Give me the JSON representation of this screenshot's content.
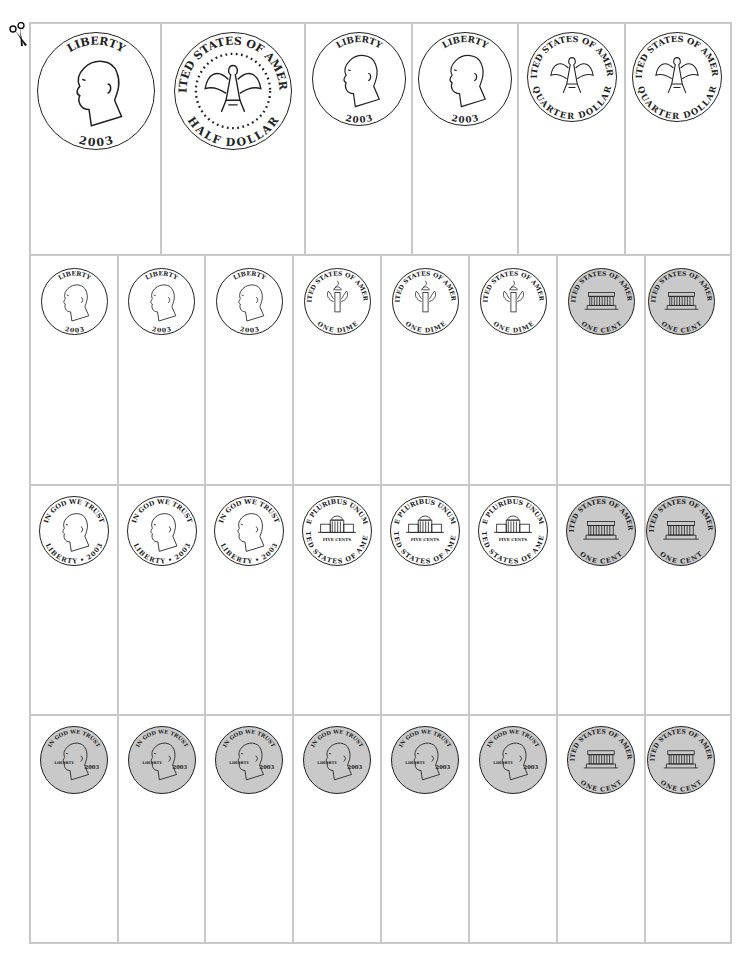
{
  "sheet": {
    "cut_marker": "scissors-icon",
    "rows": [
      {
        "name": "half-dollars-and-quarters",
        "cells": [
          {
            "coin": "half-dollar",
            "side": "heads",
            "top_text": "LIBERTY",
            "bottom_text": "2003"
          },
          {
            "coin": "half-dollar",
            "side": "tails",
            "top_text": "UNITED STATES OF AMERICA",
            "bottom_text": "HALF DOLLAR"
          },
          {
            "coin": "quarter",
            "side": "heads",
            "top_text": "LIBERTY",
            "bottom_text": "2003"
          },
          {
            "coin": "quarter",
            "side": "heads",
            "top_text": "LIBERTY",
            "bottom_text": "2003"
          },
          {
            "coin": "quarter",
            "side": "tails",
            "top_text": "UNITED STATES OF AMERICA",
            "bottom_text": "QUARTER DOLLAR"
          },
          {
            "coin": "quarter",
            "side": "tails",
            "top_text": "UNITED STATES OF AMERICA",
            "bottom_text": "QUARTER DOLLAR"
          }
        ]
      },
      {
        "name": "dimes-and-pennies",
        "cells": [
          {
            "coin": "dime",
            "side": "heads",
            "top_text": "LIBERTY",
            "bottom_text": "2003"
          },
          {
            "coin": "dime",
            "side": "heads",
            "top_text": "LIBERTY",
            "bottom_text": "2003"
          },
          {
            "coin": "dime",
            "side": "heads",
            "top_text": "LIBERTY",
            "bottom_text": "2003"
          },
          {
            "coin": "dime",
            "side": "tails",
            "top_text": "UNITED STATES OF AMERICA",
            "bottom_text": "ONE DIME"
          },
          {
            "coin": "dime",
            "side": "tails",
            "top_text": "UNITED STATES OF AMERICA",
            "bottom_text": "ONE DIME"
          },
          {
            "coin": "dime",
            "side": "tails",
            "top_text": "UNITED STATES OF AMERICA",
            "bottom_text": "ONE DIME"
          },
          {
            "coin": "penny",
            "side": "tails",
            "top_text": "UNITED STATES OF AMERICA",
            "bottom_text": "ONE CENT"
          },
          {
            "coin": "penny",
            "side": "tails",
            "top_text": "UNITED STATES OF AMERICA",
            "bottom_text": "ONE CENT"
          }
        ]
      },
      {
        "name": "nickels-and-pennies",
        "cells": [
          {
            "coin": "nickel",
            "side": "heads",
            "top_text": "IN GOD WE TRUST",
            "bottom_text": "LIBERTY • 2003"
          },
          {
            "coin": "nickel",
            "side": "heads",
            "top_text": "IN GOD WE TRUST",
            "bottom_text": "LIBERTY • 2003"
          },
          {
            "coin": "nickel",
            "side": "heads",
            "top_text": "IN GOD WE TRUST",
            "bottom_text": "LIBERTY • 2003"
          },
          {
            "coin": "nickel",
            "side": "tails",
            "top_text": "E PLURIBUS UNUM",
            "bottom_text": "UNITED STATES OF AMERICA",
            "middle_text": "FIVE CENTS"
          },
          {
            "coin": "nickel",
            "side": "tails",
            "top_text": "E PLURIBUS UNUM",
            "bottom_text": "UNITED STATES OF AMERICA",
            "middle_text": "FIVE CENTS"
          },
          {
            "coin": "nickel",
            "side": "tails",
            "top_text": "E PLURIBUS UNUM",
            "bottom_text": "UNITED STATES OF AMERICA",
            "middle_text": "FIVE CENTS"
          },
          {
            "coin": "penny",
            "side": "tails",
            "top_text": "UNITED STATES OF AMERICA",
            "bottom_text": "ONE CENT"
          },
          {
            "coin": "penny",
            "side": "tails",
            "top_text": "UNITED STATES OF AMERICA",
            "bottom_text": "ONE CENT"
          }
        ]
      },
      {
        "name": "pennies",
        "cells": [
          {
            "coin": "penny",
            "side": "heads",
            "top_text": "IN GOD WE TRUST",
            "left_text": "LIBERTY",
            "right_text": "2003"
          },
          {
            "coin": "penny",
            "side": "heads",
            "top_text": "IN GOD WE TRUST",
            "left_text": "LIBERTY",
            "right_text": "2003"
          },
          {
            "coin": "penny",
            "side": "heads",
            "top_text": "IN GOD WE TRUST",
            "left_text": "LIBERTY",
            "right_text": "2003"
          },
          {
            "coin": "penny",
            "side": "heads",
            "top_text": "IN GOD WE TRUST",
            "left_text": "LIBERTY",
            "right_text": "2003"
          },
          {
            "coin": "penny",
            "side": "heads",
            "top_text": "IN GOD WE TRUST",
            "left_text": "LIBERTY",
            "right_text": "2003"
          },
          {
            "coin": "penny",
            "side": "heads",
            "top_text": "IN GOD WE TRUST",
            "left_text": "LIBERTY",
            "right_text": "2003"
          },
          {
            "coin": "penny",
            "side": "tails",
            "top_text": "UNITED STATES OF AMERICA",
            "bottom_text": "ONE CENT"
          },
          {
            "coin": "penny",
            "side": "tails",
            "top_text": "UNITED STATES OF AMERICA",
            "bottom_text": "ONE CENT"
          }
        ]
      }
    ]
  },
  "colors": {
    "grid_line": "#c8c8c8",
    "coin_outline": "#222222",
    "penny_fill": "#c9c9c9",
    "silver_fill": "#ffffff"
  }
}
